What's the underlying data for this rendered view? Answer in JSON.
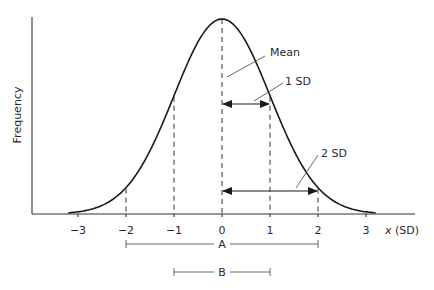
{
  "chart_data": {
    "type": "line",
    "title": "",
    "xlabel": "x (SD)",
    "ylabel": "Frequency",
    "xlim": [
      -3.2,
      3.2
    ],
    "x_ticks": [
      -3,
      -2,
      -1,
      0,
      1,
      2,
      3
    ],
    "x_tick_labels": [
      "−3",
      "−2",
      "−1",
      "0",
      "1",
      "2",
      "3"
    ],
    "curve": {
      "distribution": "normal",
      "mean": 0,
      "sd": 1
    },
    "dashed_verticals_at": [
      -2,
      -1,
      0,
      1,
      2
    ],
    "annotations": [
      {
        "label": "Mean",
        "points_to_x": 0
      },
      {
        "label": "1 SD",
        "arrow_from": 0,
        "arrow_to": 1
      },
      {
        "label": "2 SD",
        "arrow_from": 0,
        "arrow_to": 2
      }
    ],
    "ranges": [
      {
        "label": "A",
        "from": -2,
        "to": 2
      },
      {
        "label": "B",
        "from": -1,
        "to": 1
      }
    ],
    "grid": false,
    "legend": "none"
  }
}
